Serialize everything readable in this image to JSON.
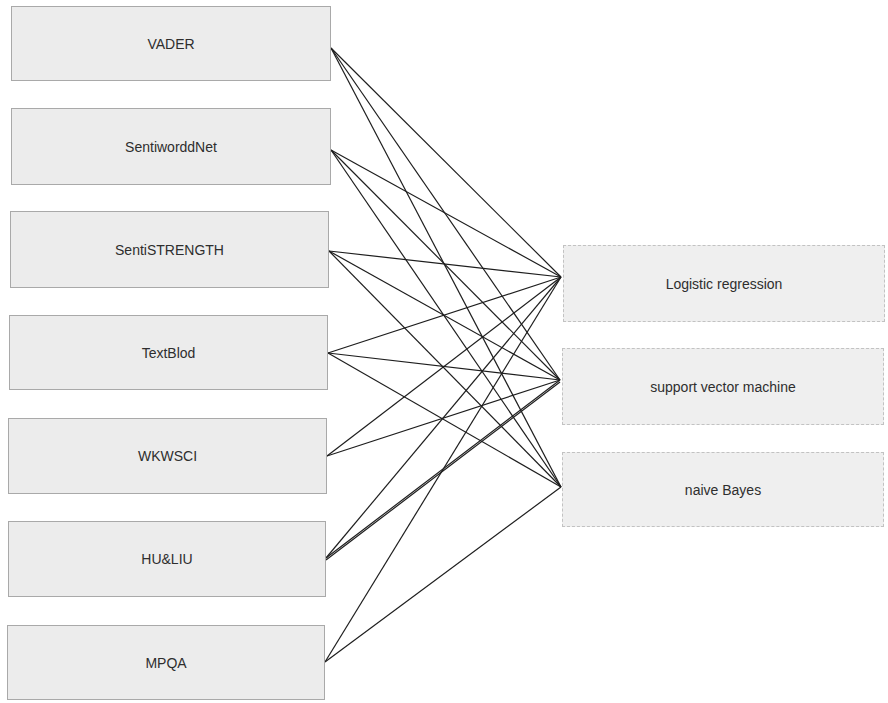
{
  "diagram": {
    "lexicons": [
      {
        "id": "vader",
        "label": "VADER",
        "x": 11,
        "y": 6,
        "w": 320,
        "h": 75,
        "port": [
          331,
          48
        ]
      },
      {
        "id": "sentiwordnet",
        "label": "SentiworddNet",
        "x": 11,
        "y": 108,
        "w": 320,
        "h": 77,
        "port": [
          331,
          150
        ]
      },
      {
        "id": "sentistrength",
        "label": "SentiSTRENGTH",
        "x": 10,
        "y": 211,
        "w": 319,
        "h": 77,
        "port": [
          329,
          251
        ]
      },
      {
        "id": "textblob",
        "label": "TextBlod",
        "x": 9,
        "y": 315,
        "w": 319,
        "h": 75,
        "port": [
          328,
          353
        ]
      },
      {
        "id": "wkwsci",
        "label": "WKWSCI",
        "x": 8,
        "y": 418,
        "w": 319,
        "h": 76,
        "port": [
          327,
          456
        ]
      },
      {
        "id": "huliu",
        "label": "HU&LIU",
        "x": 8,
        "y": 521,
        "w": 318,
        "h": 76,
        "port": [
          326,
          558
        ]
      },
      {
        "id": "mpqa",
        "label": "MPQA",
        "x": 7,
        "y": 625,
        "w": 318,
        "h": 75,
        "port": [
          325,
          662
        ]
      }
    ],
    "classifiers": [
      {
        "id": "lr",
        "label": "Logistic regression",
        "x": 563,
        "y": 245,
        "w": 322,
        "h": 77,
        "port": [
          561,
          277
        ]
      },
      {
        "id": "svm",
        "label": "support vector machine",
        "x": 562,
        "y": 348,
        "w": 322,
        "h": 77,
        "port": [
          560,
          380
        ]
      },
      {
        "id": "nb",
        "label": "naive Bayes",
        "x": 562,
        "y": 452,
        "w": 322,
        "h": 75,
        "port": [
          561,
          487
        ]
      }
    ],
    "edges": [
      [
        "vader",
        "lr"
      ],
      [
        "vader",
        "svm"
      ],
      [
        "vader",
        "nb"
      ],
      [
        "sentiwordnet",
        "lr"
      ],
      [
        "sentiwordnet",
        "svm"
      ],
      [
        "sentiwordnet",
        "nb"
      ],
      [
        "sentistrength",
        "lr"
      ],
      [
        "sentistrength",
        "svm"
      ],
      [
        "sentistrength",
        "nb"
      ],
      [
        "textblob",
        "lr"
      ],
      [
        "textblob",
        "svm"
      ],
      [
        "textblob",
        "nb"
      ],
      [
        "wkwsci",
        "lr"
      ],
      [
        "wkwsci",
        "svm"
      ],
      [
        "huliu",
        "lr"
      ],
      [
        "huliu",
        "svm"
      ],
      [
        "huliu",
        "svm"
      ],
      [
        "mpqa",
        "lr"
      ],
      [
        "mpqa",
        "nb"
      ]
    ]
  }
}
